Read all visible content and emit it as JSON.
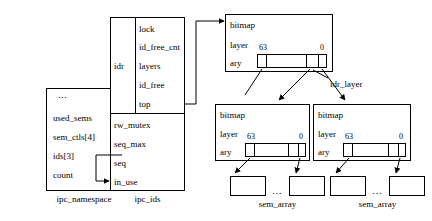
{
  "diagram": {
    "stroke_color": "#000000",
    "background_color": "#ffffff"
  },
  "ipc_namespace": {
    "caption": "ipc_namespace",
    "ellipsis": "⋮",
    "rows": [
      {
        "label": "used_sems"
      },
      {
        "label": "sem_ctls[4]"
      },
      {
        "label": "ids[3]"
      },
      {
        "label": "count"
      }
    ]
  },
  "ipc_ids": {
    "caption": "ipc_ids",
    "idr_label": "idr",
    "idr_rows": [
      {
        "label": "lock"
      },
      {
        "label": "id_free_cnt"
      },
      {
        "label": "layers"
      },
      {
        "label": "id_free"
      },
      {
        "label": "top"
      }
    ],
    "rows": [
      {
        "label": "rw_mutex"
      },
      {
        "label": "seq_max"
      },
      {
        "label": "seq"
      },
      {
        "label": "in_use"
      }
    ]
  },
  "idr_layer_label": "idr_layer",
  "idr_layers": [
    {
      "name": "top-layer",
      "rows": [
        {
          "label": "bitmap"
        },
        {
          "label": "layer"
        },
        {
          "label": "ary"
        }
      ],
      "index_high": "63",
      "index_low": "0"
    },
    {
      "name": "left-layer",
      "rows": [
        {
          "label": "bitmap"
        },
        {
          "label": "layer"
        },
        {
          "label": "ary"
        }
      ],
      "index_high": "63",
      "index_low": "0"
    },
    {
      "name": "right-layer",
      "rows": [
        {
          "label": "bitmap"
        },
        {
          "label": "layer"
        },
        {
          "label": "ary"
        }
      ],
      "index_high": "63",
      "index_low": "0"
    }
  ],
  "sem_arrays": [
    {
      "caption": "sem_array",
      "ellipsis": "…"
    },
    {
      "caption": "sem_array",
      "ellipsis": "…"
    }
  ]
}
